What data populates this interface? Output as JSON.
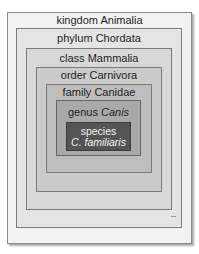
{
  "diagram": {
    "levels": [
      {
        "rank": "kingdom",
        "name": "Animalia",
        "label": "kingdom Animalia",
        "italic": false,
        "fill": "#f2f2f2"
      },
      {
        "rank": "phylum",
        "name": "Chordata",
        "label": "phylum Chordata",
        "italic": false,
        "fill": "#e4e4e4"
      },
      {
        "rank": "class",
        "name": "Mammalia",
        "label": "class Mammalia",
        "italic": false,
        "fill": "#d8d8d8"
      },
      {
        "rank": "order",
        "name": "Carnivora",
        "label": "order Carnivora",
        "italic": false,
        "fill": "#cbcbcb"
      },
      {
        "rank": "family",
        "name": "Canidae",
        "label": "family Canidae",
        "italic": false,
        "fill": "#bdbdbd"
      },
      {
        "rank": "genus",
        "name": "Canis",
        "label": "genus Canis",
        "italic": true,
        "fill": "#a9a9a9"
      },
      {
        "rank": "species",
        "name": "C. familiaris",
        "label": "species C. familiaris",
        "italic": true,
        "fill": "#545454"
      }
    ]
  }
}
